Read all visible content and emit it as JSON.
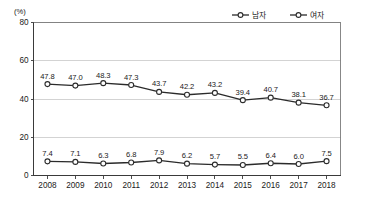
{
  "chart_data": {
    "type": "line",
    "title": "",
    "subtitle": "",
    "xlabel": "",
    "ylabel": "",
    "unit_label": "(%)",
    "categories": [
      "2008",
      "2009",
      "2010",
      "2011",
      "2012",
      "2013",
      "2014",
      "2015",
      "2016",
      "2017",
      "2018"
    ],
    "ylim": [
      0,
      80
    ],
    "yticks": [
      0,
      20,
      40,
      60,
      80
    ],
    "ytick_labels": [
      "0",
      "20",
      "40",
      "60",
      "80"
    ],
    "grid": true,
    "grid_axis": "y",
    "legend_position": "top-right",
    "series": [
      {
        "name": "남자",
        "marker": "open-circle",
        "color": "#2b2b2b",
        "values": [
          47.8,
          47.0,
          48.3,
          47.3,
          43.7,
          42.2,
          43.2,
          39.4,
          40.7,
          38.1,
          36.7
        ],
        "labels": [
          "47.8",
          "47.0",
          "48.3",
          "47.3",
          "43.7",
          "42.2",
          "43.2",
          "39.4",
          "40.7",
          "38.1",
          "36.7"
        ]
      },
      {
        "name": "여자",
        "marker": "open-circle",
        "color": "#2b2b2b",
        "values": [
          7.4,
          7.1,
          6.3,
          6.8,
          7.9,
          6.2,
          5.7,
          5.5,
          6.4,
          6.0,
          7.5
        ],
        "labels": [
          "7.4",
          "7.1",
          "6.3",
          "6.8",
          "7.9",
          "6.2",
          "5.7",
          "5.5",
          "6.4",
          "6.0",
          "7.5"
        ]
      }
    ]
  },
  "legend": {
    "items": [
      {
        "label": "남자"
      },
      {
        "label": "여자"
      }
    ]
  }
}
